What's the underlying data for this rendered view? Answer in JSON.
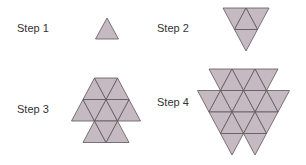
{
  "steps": [
    {
      "label": "Step 1",
      "triangles": 1
    },
    {
      "label": "Step 2",
      "triangles": 4
    },
    {
      "label": "Step 3",
      "triangles": 9
    },
    {
      "label": "Step 4",
      "triangles": 16
    }
  ],
  "colors": {
    "fill": "#c5bac1",
    "stroke": "#5e555a",
    "text": "#333333"
  }
}
